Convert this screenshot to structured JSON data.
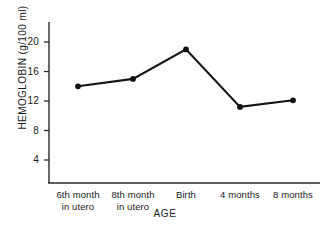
{
  "chart_data": {
    "type": "line",
    "title": "",
    "xlabel": "AGE",
    "ylabel": "HEMOGLOBIN (g/100 ml)",
    "categories": [
      "6th month\nin utero",
      "8th month\nin utero",
      "Birth",
      "4 months",
      "8 months"
    ],
    "category_lines": [
      [
        "6th month",
        "in utero"
      ],
      [
        "8th month",
        "in utero"
      ],
      [
        "Birth",
        ""
      ],
      [
        "4 months",
        ""
      ],
      [
        "8 months",
        ""
      ]
    ],
    "values": [
      14.0,
      15.0,
      19.0,
      11.2,
      12.1
    ],
    "yticks": [
      4,
      8,
      12,
      16,
      20
    ],
    "ytick_labels": [
      "4",
      "8",
      "12",
      "16",
      "20"
    ],
    "ylim": [
      2,
      22
    ],
    "grid": false,
    "legend": null,
    "series": [
      {
        "name": "Hemoglobin",
        "values": [
          14.0,
          15.0,
          19.0,
          11.2,
          12.1
        ],
        "color": "#111111",
        "marker": "filled-circle"
      }
    ]
  },
  "axes": {
    "y_axis_name": "hemoglobin-axis",
    "x_axis_name": "age-axis"
  }
}
